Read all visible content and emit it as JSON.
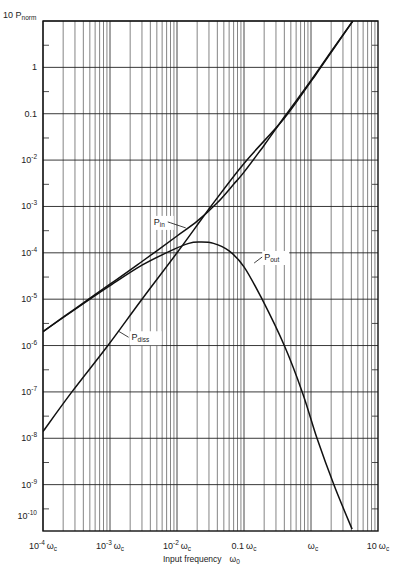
{
  "chart_data": {
    "type": "line",
    "title": "",
    "xlabel": "Input frequency",
    "xlabel_symbol": "ω",
    "xlabel_subscript": "0",
    "ylabel_prefix": "10 P",
    "ylabel_subscript": "norm",
    "x_scale": "log",
    "y_scale": "log",
    "xlim": [
      0.0001,
      10
    ],
    "ylim": [
      1e-10,
      10
    ],
    "grid": true,
    "legend": "inline-labels",
    "x_ticks": [
      {
        "value": 0.0001,
        "base": "10",
        "exp": "-4",
        "unit": "ω",
        "unit_sub": "c"
      },
      {
        "value": 0.001,
        "base": "10",
        "exp": "-3",
        "unit": "ω",
        "unit_sub": "c"
      },
      {
        "value": 0.01,
        "base": "10",
        "exp": "-2",
        "unit": "ω",
        "unit_sub": "c"
      },
      {
        "value": 0.1,
        "base": "0.1",
        "exp": "",
        "unit": "ω",
        "unit_sub": "c"
      },
      {
        "value": 1,
        "base": "",
        "exp": "",
        "unit": "ω",
        "unit_sub": "c"
      },
      {
        "value": 10,
        "base": "10",
        "exp": "",
        "unit": "ω",
        "unit_sub": "c"
      }
    ],
    "y_ticks": [
      {
        "value": 1,
        "base": "1",
        "exp": ""
      },
      {
        "value": 0.1,
        "base": "0.1",
        "exp": ""
      },
      {
        "value": 0.01,
        "base": "10",
        "exp": "-2"
      },
      {
        "value": 0.001,
        "base": "10",
        "exp": "-3"
      },
      {
        "value": 0.0001,
        "base": "10",
        "exp": "-4"
      },
      {
        "value": 1e-05,
        "base": "10",
        "exp": "-5"
      },
      {
        "value": 1e-06,
        "base": "10",
        "exp": "-6"
      },
      {
        "value": 1e-07,
        "base": "10",
        "exp": "-7"
      },
      {
        "value": 1e-08,
        "base": "10",
        "exp": "-8"
      },
      {
        "value": 1e-09,
        "base": "10",
        "exp": "-9"
      },
      {
        "value": 1e-10,
        "base": "10",
        "exp": "-10"
      }
    ],
    "series": [
      {
        "name": "P_in",
        "label": "P",
        "label_sub": "in",
        "label_at": {
          "x": 0.0045,
          "y": 0.0004
        },
        "points": [
          [
            0.0001,
            2e-06
          ],
          [
            0.0003,
            6.2e-06
          ],
          [
            0.001,
            2.1e-05
          ],
          [
            0.003,
            6.5e-05
          ],
          [
            0.01,
            0.00023
          ],
          [
            0.02,
            0.00048
          ],
          [
            0.04,
            0.0012
          ],
          [
            0.07,
            0.003
          ],
          [
            0.1,
            0.0055
          ],
          [
            0.2,
            0.021
          ],
          [
            0.4,
            0.085
          ],
          [
            1.0,
            0.52
          ],
          [
            2.0,
            2.2
          ],
          [
            4.2,
            10
          ]
        ]
      },
      {
        "name": "P_out",
        "label": "P",
        "label_sub": "out",
        "label_at": {
          "x": 0.2,
          "y": 7e-05
        },
        "points": [
          [
            0.0001,
            2e-06
          ],
          [
            0.0003,
            6e-06
          ],
          [
            0.001,
            1.95e-05
          ],
          [
            0.003,
            5.4e-05
          ],
          [
            0.008,
            0.00011
          ],
          [
            0.015,
            0.00016
          ],
          [
            0.022,
            0.00017
          ],
          [
            0.035,
            0.00016
          ],
          [
            0.06,
            0.00011
          ],
          [
            0.1,
            5e-05
          ],
          [
            0.186,
            1e-05
          ],
          [
            0.4,
            1e-06
          ],
          [
            0.74,
            1e-07
          ],
          [
            1.23,
            1e-08
          ],
          [
            2.19,
            1e-09
          ],
          [
            4.1,
            1.1e-10
          ]
        ]
      },
      {
        "name": "P_diss",
        "label": "P",
        "label_sub": "diss",
        "label_at": {
          "x": 0.0021,
          "y": 1.3e-06
        },
        "points": [
          [
            0.0001,
            1.4e-08
          ],
          [
            0.00027,
            1e-07
          ],
          [
            0.00093,
            1e-06
          ],
          [
            0.003,
            1e-05
          ],
          [
            0.01,
            0.0001
          ],
          [
            0.032,
            0.001
          ],
          [
            0.1,
            0.0085
          ],
          [
            0.4,
            0.08
          ],
          [
            1.0,
            0.5
          ],
          [
            1.4,
            1.0
          ],
          [
            4.2,
            10
          ]
        ]
      }
    ]
  }
}
